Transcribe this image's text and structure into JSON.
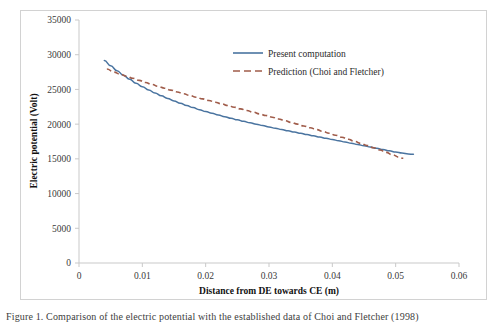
{
  "figure": {
    "caption": "Figure 1. Comparison of the electric potential with the established data of Choi and Fletcher (1998)"
  },
  "chart_data": {
    "type": "line",
    "title": "",
    "xlabel": "Distance from DE towards CE (m)",
    "ylabel": "Electric potential (Volt)",
    "xlim": [
      0,
      0.06
    ],
    "ylim": [
      0,
      35000
    ],
    "xticks": [
      "0",
      "0.01",
      "0.02",
      "0.03",
      "0.04",
      "0.05",
      "0.06"
    ],
    "xtick_values": [
      0,
      0.01,
      0.02,
      0.03,
      0.04,
      0.05,
      0.06
    ],
    "yticks": [
      "0",
      "5000",
      "10000",
      "15000",
      "20000",
      "25000",
      "30000",
      "35000"
    ],
    "ytick_values": [
      0,
      5000,
      10000,
      15000,
      20000,
      25000,
      30000,
      35000
    ],
    "grid": false,
    "legend_position": "top-right",
    "series": [
      {
        "name": "Present computation",
        "style": "solid",
        "color": "#4a74a0",
        "x": [
          0.004,
          0.005,
          0.006,
          0.007,
          0.008,
          0.009,
          0.01,
          0.011,
          0.012,
          0.013,
          0.014,
          0.015,
          0.016,
          0.017,
          0.018,
          0.019,
          0.02,
          0.021,
          0.022,
          0.023,
          0.024,
          0.025,
          0.026,
          0.027,
          0.028,
          0.029,
          0.03,
          0.031,
          0.032,
          0.033,
          0.034,
          0.035,
          0.036,
          0.037,
          0.038,
          0.039,
          0.04,
          0.041,
          0.042,
          0.043,
          0.044,
          0.045,
          0.046,
          0.047,
          0.048,
          0.049,
          0.05,
          0.051,
          0.052,
          0.0528
        ],
        "y": [
          29150,
          28400,
          27700,
          27050,
          26450,
          25900,
          25400,
          24930,
          24490,
          24080,
          23700,
          23340,
          23000,
          22680,
          22380,
          22090,
          21820,
          21560,
          21310,
          21070,
          20840,
          20620,
          20400,
          20190,
          19990,
          19790,
          19600,
          19410,
          19220,
          19040,
          18860,
          18680,
          18500,
          18320,
          18140,
          17960,
          17790,
          17610,
          17430,
          17250,
          17060,
          16880,
          16700,
          16510,
          16330,
          16150,
          15980,
          15830,
          15700,
          15650
        ]
      },
      {
        "name": "Prediction (Choi and Fletcher)",
        "style": "dashed",
        "color": "#a05c4a",
        "x": [
          0.0044,
          0.0055,
          0.0065,
          0.0075,
          0.0085,
          0.0095,
          0.0105,
          0.0115,
          0.0125,
          0.0135,
          0.0145,
          0.0155,
          0.0165,
          0.0175,
          0.0185,
          0.0195,
          0.0205,
          0.0215,
          0.0225,
          0.0235,
          0.0245,
          0.0255,
          0.0265,
          0.0275,
          0.0285,
          0.0295,
          0.0305,
          0.0315,
          0.0325,
          0.0335,
          0.0345,
          0.0355,
          0.0365,
          0.0375,
          0.0385,
          0.0395,
          0.0405,
          0.0415,
          0.0425,
          0.0435,
          0.0445,
          0.0455,
          0.0465,
          0.0475,
          0.0485,
          0.0495,
          0.0505,
          0.0512
        ],
        "y": [
          27950,
          27500,
          27200,
          26900,
          26600,
          26300,
          26000,
          25720,
          25440,
          25170,
          24900,
          24640,
          24380,
          24130,
          23880,
          23640,
          23400,
          23160,
          22920,
          22680,
          22440,
          22200,
          21960,
          21720,
          21480,
          21240,
          21000,
          20750,
          20500,
          20250,
          20000,
          19740,
          19480,
          19220,
          18950,
          18680,
          18400,
          18120,
          17830,
          17530,
          17230,
          16920,
          16600,
          16270,
          15930,
          15580,
          15250,
          15080
        ]
      }
    ]
  },
  "legend": {
    "items": [
      {
        "label": "Present computation"
      },
      {
        "label": "Prediction (Choi and Fletcher)"
      }
    ]
  }
}
